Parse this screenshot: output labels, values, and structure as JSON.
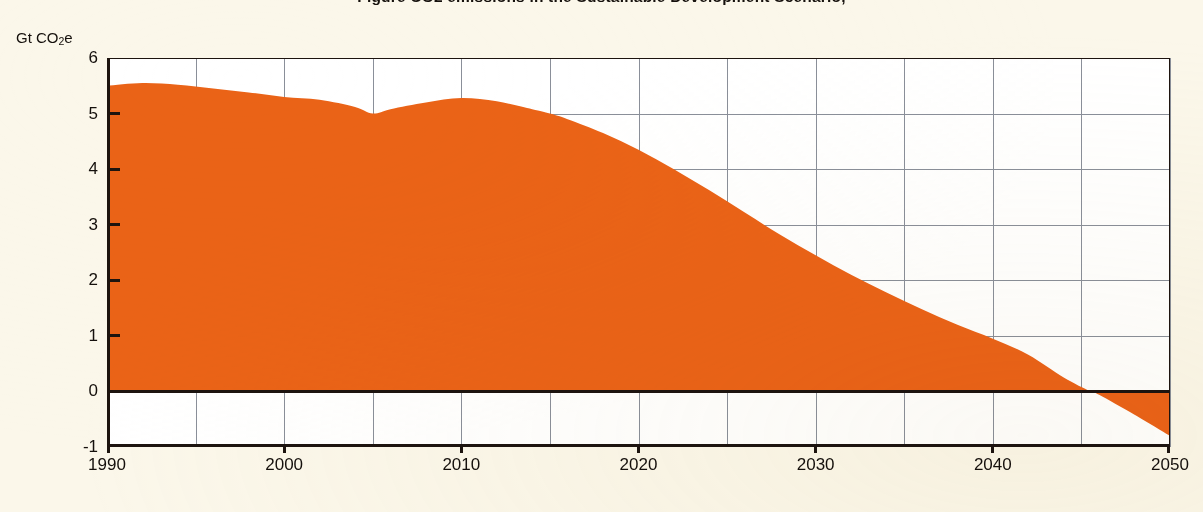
{
  "title": {
    "clipped_text": "Figure  CO2   emissions  in the Sustainable Development Scenario,"
  },
  "axes": {
    "y_unit_prefix": "Gt CO",
    "y_unit_sub": "2",
    "y_unit_suffix": "e",
    "y_ticks": [
      "6",
      "5",
      "4",
      "3",
      "2",
      "1",
      "0",
      "-1"
    ],
    "x_ticks": [
      "1990",
      "2000",
      "2010",
      "2020",
      "2030",
      "2040",
      "2050"
    ]
  },
  "colors": {
    "background": "#fbf7ea",
    "plot_background": "#ffffff",
    "area": "#ea6317",
    "axis": "#1d140f",
    "grid": "#8a8f99"
  },
  "chart_data": {
    "type": "area",
    "title": "CO2 emissions in the Sustainable Development Scenario",
    "xlabel": "",
    "ylabel": "Gt CO2e",
    "xlim": [
      1990,
      2050
    ],
    "ylim": [
      -1,
      6
    ],
    "grid": true,
    "grid_x_step": 5,
    "grid_y_step": 1,
    "legend": "none",
    "zero_crossing_year": 2045.5,
    "series": [
      {
        "name": "CO2 emissions",
        "color": "#ea6317",
        "x": [
          1990,
          1992,
          1994,
          1996,
          1998,
          2000,
          2002,
          2004,
          2005,
          2006,
          2008,
          2010,
          2012,
          2014,
          2015,
          2016,
          2018,
          2020,
          2022,
          2024,
          2026,
          2028,
          2030,
          2032,
          2034,
          2036,
          2038,
          2040,
          2042,
          2044,
          2045.5,
          2046,
          2048,
          2050
        ],
        "values": [
          5.5,
          5.55,
          5.52,
          5.45,
          5.38,
          5.3,
          5.25,
          5.12,
          5.0,
          5.08,
          5.2,
          5.28,
          5.22,
          5.08,
          5.0,
          4.9,
          4.65,
          4.35,
          4.0,
          3.62,
          3.22,
          2.82,
          2.45,
          2.1,
          1.78,
          1.48,
          1.2,
          0.95,
          0.66,
          0.25,
          0.0,
          -0.06,
          -0.42,
          -0.8
        ]
      }
    ]
  }
}
